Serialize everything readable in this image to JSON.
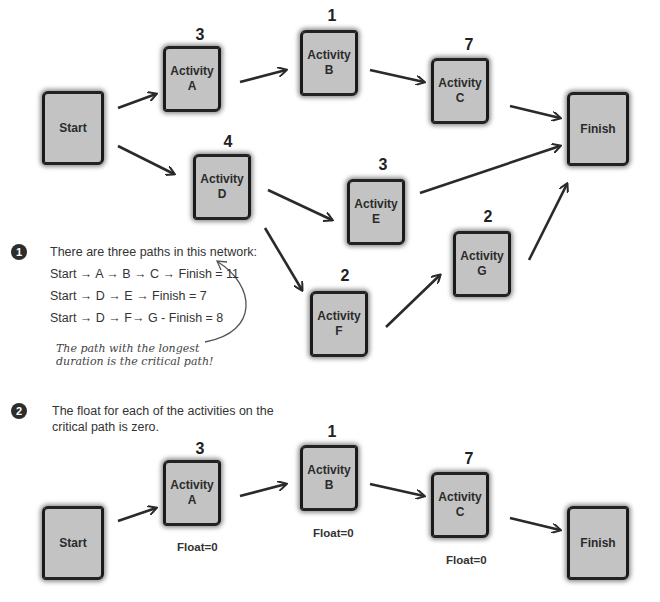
{
  "network": {
    "nodes": {
      "start": {
        "label": "Start"
      },
      "a": {
        "line1": "Activity",
        "line2": "A",
        "duration": "3"
      },
      "b": {
        "line1": "Activity",
        "line2": "B",
        "duration": "1"
      },
      "c": {
        "line1": "Activity",
        "line2": "C",
        "duration": "7"
      },
      "d": {
        "line1": "Activity",
        "line2": "D",
        "duration": "4"
      },
      "e": {
        "line1": "Activity",
        "line2": "E",
        "duration": "3"
      },
      "f": {
        "line1": "Activity",
        "line2": "F",
        "duration": "2"
      },
      "g": {
        "line1": "Activity",
        "line2": "G",
        "duration": "2"
      },
      "finish": {
        "label": "Finish"
      }
    },
    "edges": [
      [
        "Start",
        "A"
      ],
      [
        "A",
        "B"
      ],
      [
        "B",
        "C"
      ],
      [
        "C",
        "Finish"
      ],
      [
        "Start",
        "D"
      ],
      [
        "D",
        "E"
      ],
      [
        "E",
        "Finish"
      ],
      [
        "D",
        "F"
      ],
      [
        "F",
        "G"
      ],
      [
        "G",
        "Finish"
      ]
    ]
  },
  "step1": {
    "badge": "1",
    "intro": "There are three paths in this network:",
    "paths": [
      "Start → A → B → C → Finish = 11",
      "Start → D → E → Finish = 7",
      "Start → D → F→ G - Finish = 8"
    ],
    "annotation_line1": "The path with the longest",
    "annotation_line2": "duration is the critical path!"
  },
  "step2": {
    "badge": "2",
    "text_line1": "The float for each of the activities on the",
    "text_line2": "critical path is zero.",
    "nodes": {
      "start": {
        "label": "Start"
      },
      "a": {
        "line1": "Activity",
        "line2": "A",
        "duration": "3",
        "float": "Float=0"
      },
      "b": {
        "line1": "Activity",
        "line2": "B",
        "duration": "1",
        "float": "Float=0"
      },
      "c": {
        "line1": "Activity",
        "line2": "C",
        "duration": "7",
        "float": "Float=0"
      },
      "finish": {
        "label": "Finish"
      }
    }
  },
  "colors": {
    "node_fill": "#c3c3c3",
    "node_border": "#1a1a1a",
    "arrow": "#2a2a2a",
    "badge": "#2d2d2d"
  }
}
